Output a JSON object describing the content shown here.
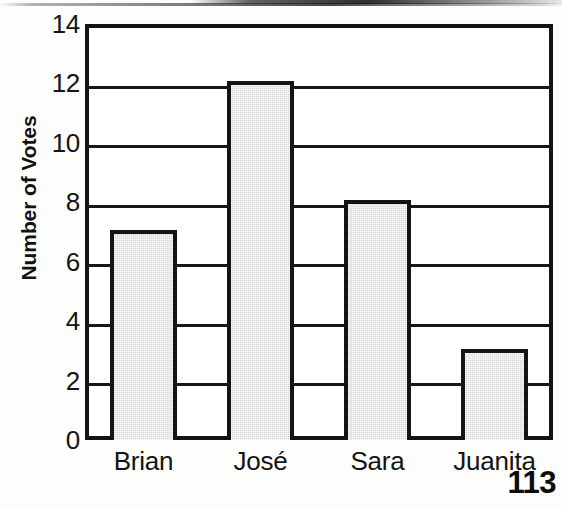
{
  "page": {
    "page_number": "113",
    "background_color": "#fdfdfc"
  },
  "chart_data": {
    "type": "bar",
    "title": "",
    "xlabel": "",
    "ylabel": "Number of Votes",
    "categories": [
      "Brian",
      "José",
      "Sara",
      "Juanita"
    ],
    "values": [
      7,
      12,
      8,
      3
    ],
    "ylim": [
      0,
      14
    ],
    "ytick_labels": [
      "0",
      "2",
      "4",
      "6",
      "8",
      "10",
      "12",
      "14"
    ],
    "ytick_values": [
      0,
      2,
      4,
      6,
      8,
      10,
      12,
      14
    ],
    "grid": "horizontal",
    "legend": "none",
    "bar_fill_color": "#d9d9d9",
    "bar_border_color": "#141414",
    "axis_color": "#141414"
  }
}
